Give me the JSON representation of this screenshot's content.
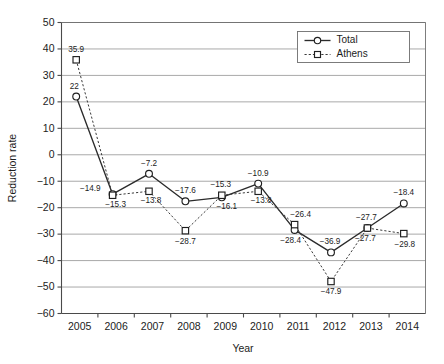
{
  "chart_data": {
    "type": "line",
    "title": "",
    "xlabel": "Year",
    "ylabel": "Reduction rate",
    "categories": [
      "2005",
      "2006",
      "2007",
      "2008",
      "2009",
      "2010",
      "2011",
      "2012",
      "2013",
      "2014"
    ],
    "x": [
      2005,
      2006,
      2007,
      2008,
      2009,
      2010,
      2011,
      2012,
      2013,
      2014
    ],
    "ylim": [
      -60,
      50
    ],
    "ytick_labels": [
      "50",
      "40",
      "30",
      "20",
      "10",
      "0",
      "−10",
      "−20",
      "−30",
      "−40",
      "−50",
      "−60"
    ],
    "ytick_values": [
      50,
      40,
      30,
      20,
      10,
      0,
      -10,
      -20,
      -30,
      -40,
      -50,
      -60
    ],
    "grid": "horizontal",
    "legend_position": "top-right inside plot",
    "series": [
      {
        "name": "Total",
        "marker": "open-circle",
        "line_style": "solid",
        "values": [
          22,
          -14.9,
          -7.2,
          -17.6,
          -16.1,
          -10.9,
          -28.4,
          -36.9,
          -27.7,
          -18.4
        ],
        "labels": [
          "22",
          "−14.9",
          "−7.2",
          "−17.6",
          "−16.1",
          "−10.9",
          "−28.4",
          "−36.9",
          "−27.7",
          "−18.4"
        ],
        "label_offsets": [
          {
            "dx": -2,
            "dy": -8,
            "anchor": "middle"
          },
          {
            "dx": -12,
            "dy": -3,
            "anchor": "end"
          },
          {
            "dx": 0,
            "dy": -8,
            "anchor": "middle"
          },
          {
            "dx": 0,
            "dy": -8,
            "anchor": "middle"
          },
          {
            "dx": 5,
            "dy": 12,
            "anchor": "middle"
          },
          {
            "dx": 0,
            "dy": -8,
            "anchor": "middle"
          },
          {
            "dx": -4,
            "dy": 13,
            "anchor": "middle"
          },
          {
            "dx": -1,
            "dy": -8,
            "anchor": "middle"
          },
          {
            "dx": -2,
            "dy": 13,
            "anchor": "middle"
          },
          {
            "dx": 0,
            "dy": -8,
            "anchor": "middle"
          }
        ]
      },
      {
        "name": "Athens",
        "marker": "open-square",
        "line_style": "dashed",
        "values": [
          35.9,
          -15.3,
          -13.8,
          -28.7,
          -15.3,
          -13.8,
          -26.4,
          -47.9,
          -27.7,
          -29.8
        ],
        "labels": [
          "35.9",
          "−15.3",
          "−13.8",
          "−28.7",
          "−15.3",
          "−13.8",
          "−26.4",
          "−47.9",
          "−27.7",
          "−29.8"
        ],
        "label_offsets": [
          {
            "dx": 0,
            "dy": -8,
            "anchor": "middle"
          },
          {
            "dx": 3,
            "dy": 12,
            "anchor": "middle"
          },
          {
            "dx": 2,
            "dy": 12,
            "anchor": "middle"
          },
          {
            "dx": 0,
            "dy": 13,
            "anchor": "middle"
          },
          {
            "dx": -1,
            "dy": -8,
            "anchor": "middle"
          },
          {
            "dx": 3,
            "dy": 12,
            "anchor": "middle"
          },
          {
            "dx": 6,
            "dy": -8,
            "anchor": "middle"
          },
          {
            "dx": 0,
            "dy": 13,
            "anchor": "middle"
          },
          {
            "dx": -1,
            "dy": -8,
            "anchor": "middle"
          },
          {
            "dx": 1,
            "dy": 13,
            "anchor": "middle"
          }
        ]
      }
    ]
  },
  "legend": {
    "entries": [
      {
        "label": "Total",
        "marker": "open-circle",
        "style": "solid"
      },
      {
        "label": "Athens",
        "marker": "open-square",
        "style": "dashed"
      }
    ]
  },
  "axes": {
    "x_title": "Year",
    "y_title": "Reduction rate"
  }
}
